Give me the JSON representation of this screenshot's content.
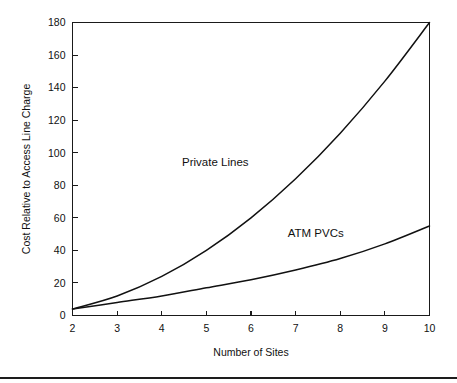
{
  "figure": {
    "background_color": "#ffffff",
    "line_color": "#111111",
    "axis_color": "#1a1a1a",
    "footer_rule_color": "#1d1d1d"
  },
  "chart_data": {
    "type": "line",
    "title": "",
    "xlabel": "Number of Sites",
    "ylabel": "Cost Relative to Access Line Charge",
    "x": [
      2,
      3,
      4,
      5,
      6,
      7,
      8,
      9,
      10
    ],
    "xlim": [
      2,
      10
    ],
    "ylim": [
      0,
      180
    ],
    "xticks": [
      2,
      3,
      4,
      5,
      6,
      7,
      8,
      9,
      10
    ],
    "xtick_labels": [
      "2",
      "3",
      "4",
      "5",
      "6",
      "7",
      "8",
      "9",
      "10"
    ],
    "yticks": [
      0,
      20,
      40,
      60,
      80,
      100,
      120,
      140,
      160,
      180
    ],
    "ytick_labels": [
      "0",
      "20",
      "40",
      "60",
      "80",
      "100",
      "120",
      "140",
      "160",
      "180"
    ],
    "grid": false,
    "legend": "inline-annotations",
    "series": [
      {
        "name": "Private Lines",
        "label_x": 5.2,
        "label_y": 92,
        "values": [
          4,
          12,
          24,
          40,
          60,
          84,
          112,
          144,
          180
        ]
      },
      {
        "name": "ATM PVCs",
        "label_x": 7.45,
        "label_y": 48,
        "values": [
          4,
          8,
          12,
          17,
          22,
          28,
          35,
          44,
          55
        ]
      }
    ],
    "annotations": [
      {
        "text": "Private Lines",
        "x": 5.2,
        "y": 92
      },
      {
        "text": "ATM PVCs",
        "x": 7.45,
        "y": 48
      }
    ]
  }
}
